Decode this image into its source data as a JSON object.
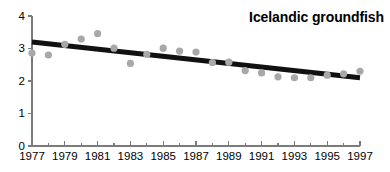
{
  "figure": {
    "title": "Icelandic groundfish",
    "width": 390,
    "height": 172,
    "background": "#ffffff"
  },
  "colors": {
    "point": "#a8a8a8",
    "trend": "#111111",
    "axis": "#7b7b7b",
    "text": "#000000"
  },
  "chart_data": {
    "type": "scatter",
    "title": "Icelandic groundfish",
    "xlabel": "",
    "ylabel": "",
    "xlim": [
      1977,
      1997
    ],
    "ylim": [
      0,
      4
    ],
    "grid": false,
    "legend": null,
    "x_tick_labels": [
      "1977",
      "1979",
      "1981",
      "1983",
      "1985",
      "1987",
      "1989",
      "1991",
      "1993",
      "1995",
      "1997"
    ],
    "x_tick_values": [
      1977,
      1979,
      1981,
      1983,
      1985,
      1987,
      1989,
      1991,
      1993,
      1995,
      1997
    ],
    "x_minor_tick_values": [
      1978,
      1980,
      1982,
      1984,
      1986,
      1988,
      1990,
      1992,
      1994,
      1996
    ],
    "y_tick_labels": [
      "0",
      "1",
      "2",
      "3",
      "4"
    ],
    "y_tick_values": [
      0,
      1,
      2,
      3,
      4
    ],
    "x": [
      1977,
      1978,
      1979,
      1980,
      1981,
      1982,
      1983,
      1984,
      1985,
      1986,
      1987,
      1988,
      1989,
      1990,
      1991,
      1992,
      1993,
      1994,
      1995,
      1996,
      1997
    ],
    "values": [
      2.86,
      2.8,
      3.13,
      3.29,
      3.46,
      3.01,
      2.54,
      2.82,
      3.01,
      2.92,
      2.89,
      2.57,
      2.58,
      2.32,
      2.25,
      2.13,
      2.1,
      2.1,
      2.18,
      2.22,
      2.3
    ],
    "series": [
      {
        "name": "Icelandic groundfish",
        "type": "scatter",
        "marker": "circle",
        "color": "#a8a8a8",
        "x": [
          1977,
          1978,
          1979,
          1980,
          1981,
          1982,
          1983,
          1984,
          1985,
          1986,
          1987,
          1988,
          1989,
          1990,
          1991,
          1992,
          1993,
          1994,
          1995,
          1996,
          1997
        ],
        "values": [
          2.86,
          2.8,
          3.13,
          3.29,
          3.46,
          3.01,
          2.54,
          2.82,
          3.01,
          2.92,
          2.89,
          2.57,
          2.58,
          2.32,
          2.25,
          2.13,
          2.1,
          2.1,
          2.18,
          2.22,
          2.3
        ]
      },
      {
        "name": "trend line",
        "type": "line",
        "color": "#111111",
        "x": [
          1977,
          1997
        ],
        "values": [
          3.2,
          2.1
        ]
      }
    ]
  }
}
